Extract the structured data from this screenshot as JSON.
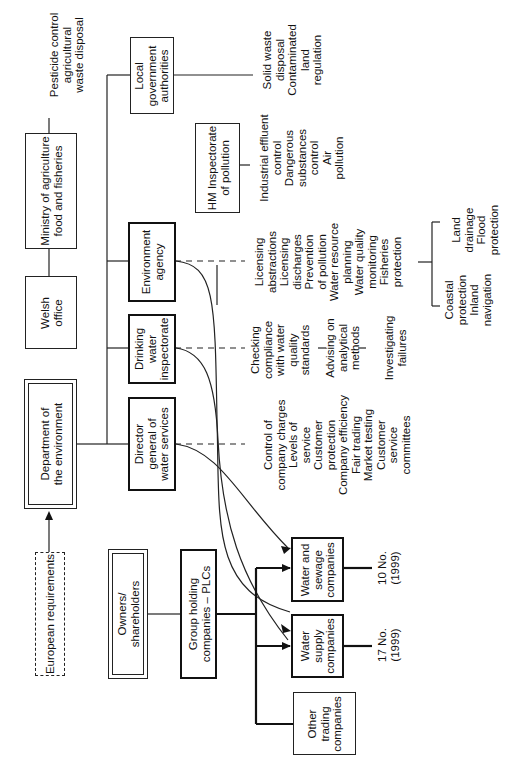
{
  "diagram": {
    "boxes": {
      "european_requirements": "European requirements",
      "department_environment": "Department of\nthe environment",
      "welsh_office": "Welsh\noffice",
      "maff": "Ministry of agriculture\nfood and fisheries",
      "local_government": "Local\ngovernment\nauthorities",
      "hm_inspectorate": "HM Inspectorate\nof pollution",
      "environment_agency": "Environment\nagency",
      "drinking_water_inspectorate": "Drinking\nwater\ninspectorate",
      "director_general": "Director\ngeneral of\nwater services",
      "owners": "Owners/\nshareholders",
      "group_holding": "Group holding\ncompanies – PLCs",
      "water_sewage": "Water and\nsewage\ncompanies",
      "water_supply": "Water\nsupply\ncompanies",
      "other_trading": "Other\ntrading\ncompanies"
    },
    "functions": {
      "maff": "Pesticide control\nagricultural\nwaste disposal",
      "local_government": "Solid waste\ndisposal\nContaminated\nland\nregulation",
      "hm_inspectorate": "Industrial effluent\ncontrol\nDangerous\nsubstances\ncontrol\nAir\npollution",
      "environment_agency": "Licensing\nabstractions\nLicensing\ndischarges\nPrevention\nof pollution\nWater resource\nplanning\nWater quality\nmonitoring\nFisheries\nprotection",
      "environment_agency_sub_left": "Coastal\nprotection\nInland\nnavigation",
      "environment_agency_sub_right": "Land\ndrainage\nFlood\nprotection",
      "drinking_water_inspectorate": "Checking\ncompliance\nwith water\nquality\nstandards",
      "drinking_water_advising": "Advising on\nanalytical\nmethods",
      "drinking_water_investigating": "Investigating\nfailures",
      "director_general": "Control of\ncompany charges\nLevels of\nservice\nCustomer\nprotection\nCompany efficiency\nFair trading\nMarket testing\nCustomer\nservice\ncommittees"
    },
    "counts": {
      "water_sewage": "10 No.\n(1999)",
      "water_supply": "17 No.\n(1999)"
    }
  }
}
